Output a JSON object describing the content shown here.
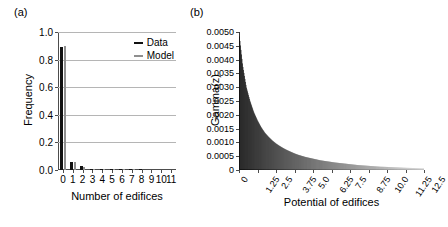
{
  "figure": {
    "panel_a_label": "(a)",
    "panel_b_label": "(b)"
  },
  "chart_data": [
    {
      "type": "bar",
      "panel": "(a)",
      "title": "",
      "xlabel": "Number of edifices",
      "ylabel": "Frequency",
      "categories": [
        "0",
        "1",
        "2",
        "3",
        "4",
        "5",
        "6",
        "7",
        "8",
        "9",
        "10",
        "11"
      ],
      "series": [
        {
          "name": "Data",
          "color": "#111111",
          "values": [
            0.89,
            0.06,
            0.03,
            0.008,
            0.004,
            0.002,
            0.002,
            0.001,
            0.001,
            0.0,
            0.0,
            0.0
          ]
        },
        {
          "name": "Model",
          "color": "#8f8f8f",
          "values": [
            0.9,
            0.055,
            0.025,
            0.009,
            0.004,
            0.002,
            0.001,
            0.001,
            0.0,
            0.0,
            0.0,
            0.0
          ]
        }
      ],
      "ylim": [
        0.0,
        1.0
      ],
      "yticks": [
        "0.0",
        "0.2",
        "0.4",
        "0.6",
        "0.8",
        "1.0"
      ],
      "ytick_values": [
        0.0,
        0.2,
        0.4,
        0.6,
        0.8,
        1.0
      ],
      "grid": "horizontal",
      "legend_position": "top-right",
      "legend": [
        "Data",
        "Model"
      ]
    },
    {
      "type": "area",
      "panel": "(b)",
      "title": "",
      "xlabel": "Potential of edifices",
      "ylabel": "Gamma(z)",
      "xticks": [
        "0",
        "1.25",
        "2.5",
        "3.75",
        "5.0",
        "6.25",
        "7.5",
        "8.75",
        "10.0",
        "11.25",
        "12.5"
      ],
      "xtick_values": [
        0,
        1.25,
        2.5,
        3.75,
        5.0,
        6.25,
        7.5,
        8.75,
        10.0,
        11.25,
        12.5
      ],
      "xlim": [
        0,
        12.5
      ],
      "yticks": [
        "0",
        "0.0005",
        "0.0010",
        "0.0015",
        "0.0020",
        "0.0025",
        "0.0030",
        "0.0035",
        "0.0040",
        "0.0045",
        "0.0050"
      ],
      "ytick_values": [
        0,
        0.0005,
        0.001,
        0.0015,
        0.002,
        0.0025,
        0.003,
        0.0035,
        0.004,
        0.0045,
        0.005
      ],
      "ylim": [
        0,
        0.005
      ],
      "grid": "off",
      "x": [
        0.0,
        0.25,
        0.5,
        0.75,
        1.0,
        1.25,
        1.5,
        1.75,
        2.0,
        2.25,
        2.5,
        2.75,
        3.0,
        3.25,
        3.5,
        3.75,
        4.0,
        4.25,
        4.5,
        4.75,
        5.0,
        5.5,
        6.0,
        6.25,
        6.5,
        7.0,
        7.5,
        8.0,
        8.75,
        9.5,
        10.0,
        11.25,
        12.5
      ],
      "values": [
        0.005,
        0.0038,
        0.003,
        0.0025,
        0.0021,
        0.0018,
        0.00155,
        0.00135,
        0.0012,
        0.00107,
        0.00096,
        0.00087,
        0.00079,
        0.00072,
        0.00066,
        0.0006,
        0.00055,
        0.00051,
        0.00047,
        0.00044,
        0.00041,
        0.00035,
        0.00031,
        0.00029,
        0.00027,
        0.00024,
        0.00021,
        0.00018,
        0.00015,
        0.00012,
        0.00011,
        8e-05,
        6e-05
      ],
      "fill_gradient": [
        "#000000",
        "#d8d8d8"
      ]
    }
  ]
}
